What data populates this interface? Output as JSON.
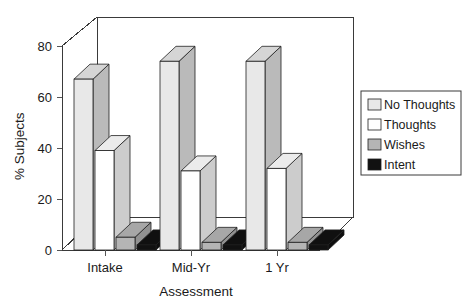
{
  "chart_data": {
    "type": "bar",
    "title": "",
    "subtitle": "",
    "xlabel": "Assessment",
    "ylabel": "% Subjects",
    "categories": [
      "Intake",
      "Mid-Yr",
      "1 Yr"
    ],
    "series": [
      {
        "name": "No Thoughts",
        "values": [
          67,
          74,
          74
        ],
        "color": "#e8e8e8"
      },
      {
        "name": "Thoughts",
        "values": [
          39,
          31,
          32
        ],
        "color": "#ffffff"
      },
      {
        "name": "Wishes",
        "values": [
          5,
          3,
          3
        ],
        "color": "#b5b5b5"
      },
      {
        "name": "Intent",
        "values": [
          2,
          2,
          2
        ],
        "color": "#111111"
      }
    ],
    "ylim": [
      0,
      80
    ],
    "yticks": [
      0,
      20,
      40,
      60,
      80
    ],
    "ytick_labels": [
      "0",
      "20",
      "40",
      "60",
      "80"
    ],
    "grid": false,
    "legend_position": "right",
    "style": "3d-bar"
  },
  "axes": {
    "y_title": "% Subjects",
    "x_title": "Assessment",
    "y_ticks": [
      "0",
      "20",
      "40",
      "60",
      "80"
    ],
    "x_ticks": [
      "Intake",
      "Mid-Yr",
      "1 Yr"
    ]
  },
  "legend": {
    "items": [
      {
        "label": "No Thoughts",
        "swatch": "light-gray"
      },
      {
        "label": "Thoughts",
        "swatch": "white"
      },
      {
        "label": "Wishes",
        "swatch": "gray"
      },
      {
        "label": "Intent",
        "swatch": "black"
      }
    ]
  },
  "colors": {
    "series_no_thoughts": "#e8e8e8",
    "series_thoughts": "#ffffff",
    "series_wishes": "#b5b5b5",
    "series_intent": "#111111",
    "axis": "#3a3a3a",
    "text": "#1a1a1a",
    "background": "#ffffff"
  }
}
